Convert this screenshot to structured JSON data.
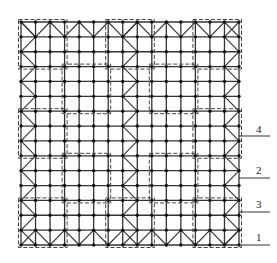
{
  "diagram": {
    "type": "grid-structure-plan",
    "grid": {
      "cols": 15,
      "rows": 15,
      "x0": 21,
      "y0": 22,
      "x1": 239,
      "y1": 245,
      "line_color": "#333333",
      "node_color": "#111111"
    },
    "block_size": 3,
    "dashed_color": "#444444",
    "labels": [
      {
        "text": "4",
        "x": 256,
        "y": 134,
        "line_y": 136
      },
      {
        "text": "2",
        "x": 256,
        "y": 175,
        "line_y": 178
      },
      {
        "text": "3",
        "x": 256,
        "y": 209,
        "line_y": 212
      },
      {
        "text": "1",
        "x": 256,
        "y": 242,
        "line_y": 245
      }
    ]
  }
}
